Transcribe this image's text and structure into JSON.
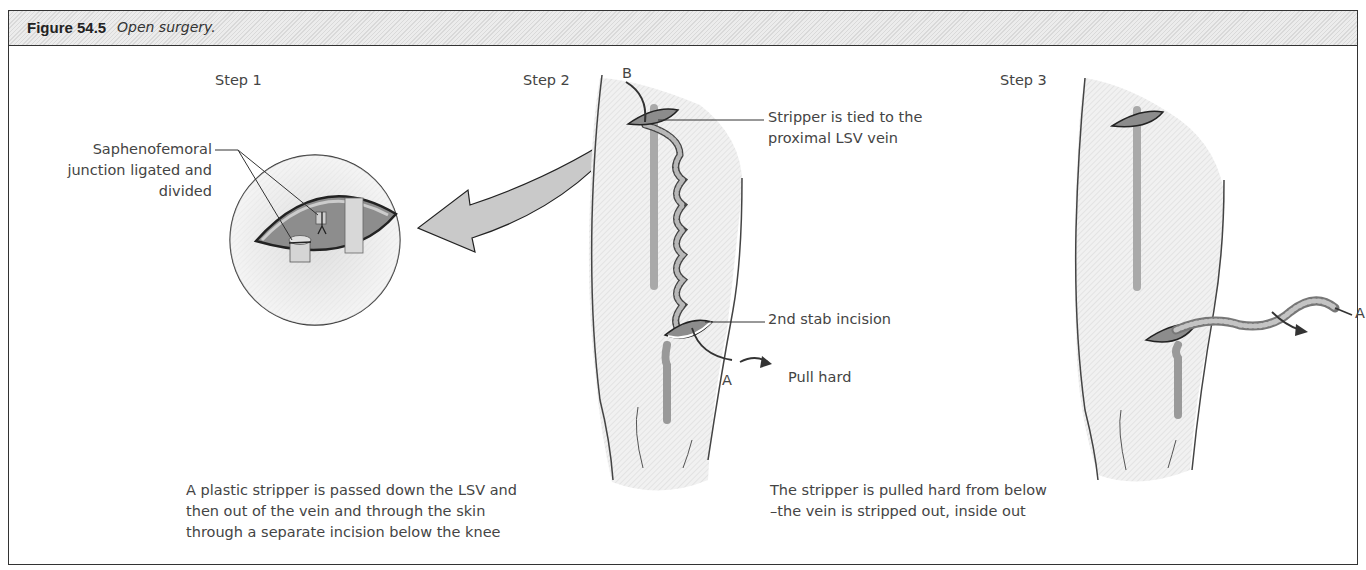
{
  "figure": {
    "number": "Figure 54.5",
    "caption": "Open surgery."
  },
  "steps": [
    {
      "title": "Step 1",
      "annotations": [
        {
          "line1": "Saphenofemoral",
          "line2": "junction ligated and",
          "line3": "divided"
        }
      ]
    },
    {
      "title": "Step 2",
      "markers": {
        "top": "B",
        "bottom": "A"
      },
      "annotations": [
        {
          "line1": "Stripper is tied  to the",
          "line2": "proximal LSV vein"
        },
        {
          "line1": "2nd stab incision"
        },
        {
          "line1": "Pull hard"
        }
      ],
      "description": {
        "line1": "A plastic stripper is passed  down the LSV and",
        "line2": "then out of  the vein and through the skin",
        "line3": "through a separate incision below the knee"
      }
    },
    {
      "title": "Step 3",
      "markers": {
        "end": "A"
      },
      "description": {
        "line1": "The stripper is pulled hard from below",
        "line2": "–the vein is stripped out, inside out"
      }
    }
  ],
  "colors": {
    "skin": "#ececec",
    "incision": "#8c8c8c",
    "vein": "#a5a5a5",
    "outline": "#333333"
  }
}
